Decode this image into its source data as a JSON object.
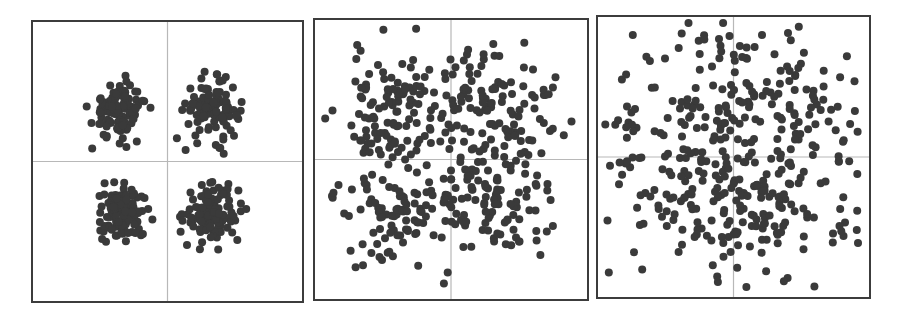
{
  "chart_data": [
    {
      "type": "scatter",
      "title": "",
      "description": "Four tight, well-separated clusters, one per quadrant",
      "xlim": [
        -1,
        1
      ],
      "ylim": [
        -1,
        1
      ],
      "grid": "center crosshair",
      "point_color": "#3a3a3a",
      "clusters": [
        {
          "cx": -0.36,
          "cy": 0.37,
          "spread": 0.1,
          "n": 110
        },
        {
          "cx": 0.33,
          "cy": 0.37,
          "spread": 0.1,
          "n": 110
        },
        {
          "cx": -0.33,
          "cy": -0.37,
          "spread": 0.1,
          "n": 110
        },
        {
          "cx": 0.33,
          "cy": -0.37,
          "spread": 0.1,
          "n": 110
        }
      ]
    },
    {
      "type": "scatter",
      "title": "",
      "description": "Four overlapping, diffuse clusters",
      "xlim": [
        -1,
        1
      ],
      "ylim": [
        -1,
        1
      ],
      "grid": "center crosshair",
      "point_color": "#3a3a3a",
      "clusters": [
        {
          "cx": -0.4,
          "cy": 0.35,
          "spread": 0.22,
          "n": 110
        },
        {
          "cx": 0.35,
          "cy": 0.38,
          "spread": 0.22,
          "n": 110
        },
        {
          "cx": -0.38,
          "cy": -0.35,
          "spread": 0.22,
          "n": 110
        },
        {
          "cx": 0.3,
          "cy": -0.3,
          "spread": 0.22,
          "n": 110
        }
      ]
    },
    {
      "type": "scatter",
      "title": "",
      "description": "Nearly uniform scatter with no discernible clusters",
      "xlim": [
        -1,
        1
      ],
      "ylim": [
        -1,
        1
      ],
      "grid": "center crosshair",
      "point_color": "#3a3a3a",
      "clusters": [
        {
          "cx": -0.3,
          "cy": 0.3,
          "spread": 0.42,
          "n": 110
        },
        {
          "cx": 0.3,
          "cy": 0.3,
          "spread": 0.42,
          "n": 110
        },
        {
          "cx": -0.3,
          "cy": -0.3,
          "spread": 0.42,
          "n": 110
        },
        {
          "cx": 0.3,
          "cy": -0.3,
          "spread": 0.42,
          "n": 110
        }
      ]
    }
  ],
  "panels": [
    {
      "left": 31,
      "top": 20,
      "width": 273,
      "height": 283
    },
    {
      "left": 313,
      "top": 18,
      "width": 276,
      "height": 283
    },
    {
      "left": 596,
      "top": 15,
      "width": 275,
      "height": 284
    }
  ]
}
